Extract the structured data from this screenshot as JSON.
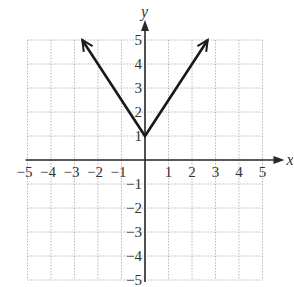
{
  "chart_data": {
    "type": "line",
    "title": "",
    "xlabel": "x",
    "ylabel": "y",
    "xlim": [
      -5,
      5
    ],
    "ylim": [
      -5,
      5
    ],
    "grid": true,
    "x_ticks": [
      -5,
      -4,
      -3,
      -2,
      -1,
      1,
      2,
      3,
      4,
      5
    ],
    "y_ticks": [
      -5,
      -4,
      -3,
      -2,
      -1,
      1,
      2,
      3,
      4,
      5
    ],
    "x_tick_labels": [
      "−5",
      "−4",
      "−3",
      "−2",
      "−1",
      "1",
      "2",
      "3",
      "4",
      "5"
    ],
    "y_tick_labels": [
      "−5",
      "−4",
      "−3",
      "−2",
      "−1",
      "1",
      "2",
      "3",
      "4",
      "5"
    ],
    "series": [
      {
        "name": "y = 1.5|x| + 1",
        "x": [
          -2.67,
          0,
          2.67
        ],
        "y": [
          5,
          1,
          5
        ],
        "arrows_at_ends": true,
        "color": "#1a1a1a"
      }
    ],
    "legend": null
  },
  "colors": {
    "grid": "#b8b8b8",
    "axis": "#2a2a2a",
    "curve": "#1a1a1a"
  }
}
